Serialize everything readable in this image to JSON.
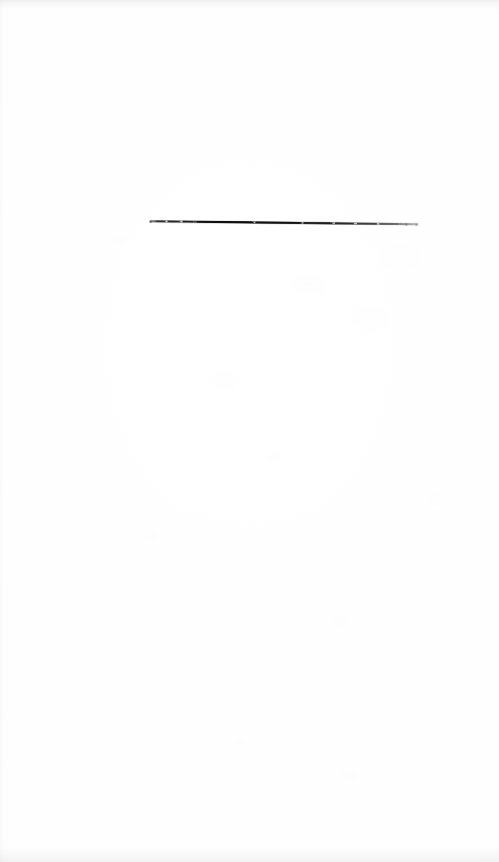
{
  "page": {
    "kind": "scanned-blank-page",
    "width_px": 499,
    "height_px": 862,
    "background_color": "#ffffff",
    "paper_tone": "#fdfdfd",
    "visible_text": ""
  },
  "marks": {
    "rule": {
      "id": "horizontal-rule",
      "ink_color": "#1a1a1a",
      "faded_ink_color": "#6b6b6b",
      "start_x": 150,
      "end_x": 418,
      "y": 222,
      "thickness_px": 2,
      "orientation": "horizontal",
      "tilt": "slight downward to the right",
      "density_note": "darkest between x=200 and x=330; fades to grey after x=360"
    },
    "flecks": [
      {
        "id": "left-tip-fleck",
        "x": 150,
        "y": 222,
        "size_px": 2
      },
      {
        "id": "right-fleck-a",
        "x": 406,
        "y": 224,
        "size_px": 2
      },
      {
        "id": "right-fleck-b",
        "x": 416,
        "y": 224,
        "size_px": 2
      }
    ]
  },
  "edges": {
    "top_band_label": "top scan edge shading",
    "bottom_band_label": "bottom scan edge shading",
    "left_band_label": "left scan edge shading"
  }
}
